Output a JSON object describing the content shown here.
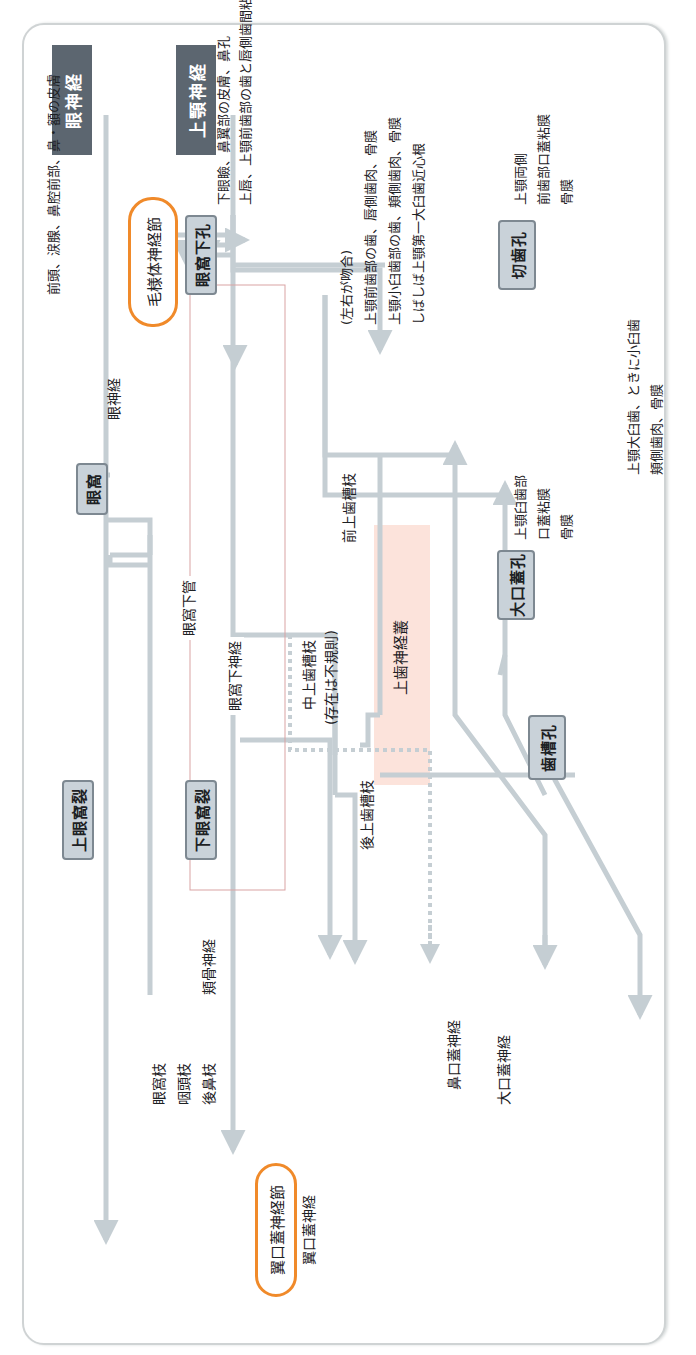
{
  "roots": {
    "ophthalmic": "眼神経",
    "maxillary": "上顎神経"
  },
  "foramina": {
    "superior_orbital_fissure": "上眼窩裂",
    "inferior_orbital_fissure": "下眼窩裂",
    "orbit": "眼窩",
    "infraorbital_foramen": "眼窩下孔",
    "incisive_foramen": "切歯孔",
    "greater_palatine_foramen": "大口蓋孔",
    "alveolar_foramen": "歯槽孔"
  },
  "ganglia": {
    "ciliary": "毛様体神経節",
    "pterygopalatine": "翼口蓋神経節"
  },
  "nerves": {
    "orbital_branch": "眼窩枝",
    "pharyngeal_branch": "咽頭枝",
    "posterior_nasal_branch": "後鼻枝",
    "zygomatic_nerve": "頬骨神経",
    "pterygopalatine_nerve": "翼口蓋神経",
    "nasopalatine_nerve": "鼻口蓋神経",
    "greater_palatine_nerve": "大口蓋神経",
    "posterior_superior_alveolar": "後上歯槽枝",
    "middle_superior_alveolar": "中上歯槽枝",
    "middle_note": "(存在は不規則)",
    "anterior_superior_alveolar": "前上歯槽枝",
    "infraorbital_canal": "眼窩下管",
    "infraorbital_nerve": "眼窩下神経",
    "optic_nerve": "眼神経",
    "superior_dental_plexus": "上歯神経叢"
  },
  "targets": {
    "frontal": "前頭、涙腺、鼻腔前部、鼻・額の皮膚",
    "infraorbital_1": "下眼瞼、鼻翼部の皮膚、鼻孔",
    "infraorbital_2": "上唇、上顎前歯部の歯と唇側歯間粘膜",
    "bilateral_note": "(左右が吻合)",
    "dental_1": "上顎前歯部の歯、唇側歯肉、骨膜",
    "dental_2": "上顎小臼歯部の歯、頬側歯肉、骨膜",
    "dental_3": "しばしば上顎第一大臼歯近心根",
    "incisive_1": "上顎両側",
    "incisive_2": "前歯部口蓋粘膜",
    "incisive_3": "骨膜",
    "palatine_1": "上顎臼歯部",
    "palatine_2": "口蓋粘膜",
    "palatine_3": "骨膜",
    "molar_1": "上顎大臼歯、ときに小臼歯",
    "molar_2": "頬側歯肉、骨膜"
  },
  "colors": {
    "line": "#c5ced3",
    "box_fill": "#c9d2d9",
    "root_fill": "#5c6670",
    "ganglion_border": "#f08a2a",
    "plexus_fill": "#fbd9cf",
    "canal_line": "#d9a3a3"
  }
}
